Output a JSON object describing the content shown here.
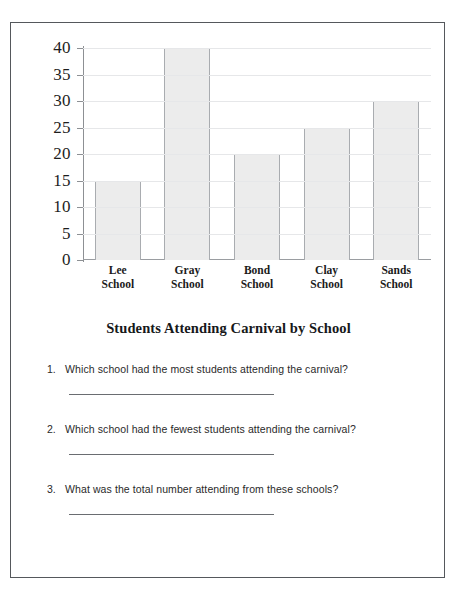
{
  "worksheet": {
    "title": "Students Attending Carnival by School",
    "questions": [
      {
        "number": "1.",
        "text": "Which school had the most students attending the carnival?",
        "answer": ""
      },
      {
        "number": "2.",
        "text": "Which school had the fewest students attending the carnival?",
        "answer": ""
      },
      {
        "number": "3.",
        "text": "What was the total number attending from these schools?",
        "answer": ""
      }
    ]
  },
  "chart_data": {
    "type": "bar",
    "title": "Students Attending Carnival by School",
    "xlabel": "",
    "ylabel": "",
    "categories": [
      "Lee School",
      "Gray School",
      "Bond School",
      "Clay School",
      "Sands School"
    ],
    "category_lines": [
      [
        "Lee",
        "School"
      ],
      [
        "Gray",
        "School"
      ],
      [
        "Bond",
        "School"
      ],
      [
        "Clay",
        "School"
      ],
      [
        "Sands",
        "School"
      ]
    ],
    "values": [
      15,
      40,
      20,
      25,
      30
    ],
    "ylim": [
      0,
      40
    ],
    "ytick_step": 5,
    "yticks": [
      0,
      5,
      10,
      15,
      20,
      25,
      30,
      35,
      40
    ],
    "ytick_labels": [
      "0",
      "5",
      "10",
      "15",
      "20",
      "25",
      "30",
      "35",
      "40"
    ],
    "grid": true,
    "legend": false,
    "bar_fill_color": "#ececec",
    "bar_border_color": "#a9acb0",
    "axis_color": "#8d9094",
    "gridline_color": "#e6e7e9"
  }
}
